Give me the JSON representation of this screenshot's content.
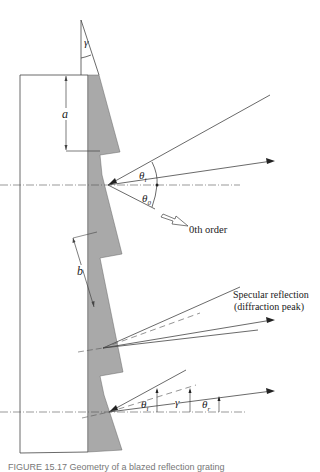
{
  "figure": {
    "labels": {
      "gamma_top": "γ",
      "a": "a",
      "b": "b",
      "theta_i_upper": "θ",
      "theta_i_sub": "i",
      "theta_0": "θ",
      "theta_0_sub": "0",
      "zeroth_order": "0th order",
      "specular_line1": "Specular reflection",
      "specular_line2": "(diffraction peak)",
      "theta_i_lower": "θ",
      "theta_i_lower_sub": "i",
      "gamma_lower": "γ",
      "theta_r": "θ",
      "theta_r_sub": "r"
    },
    "colors": {
      "grating_fill": "#a9a9a9",
      "line": "#333333",
      "background": "#ffffff"
    },
    "caption": "FIGURE 15.17 Geometry of a blazed reflection grating"
  }
}
